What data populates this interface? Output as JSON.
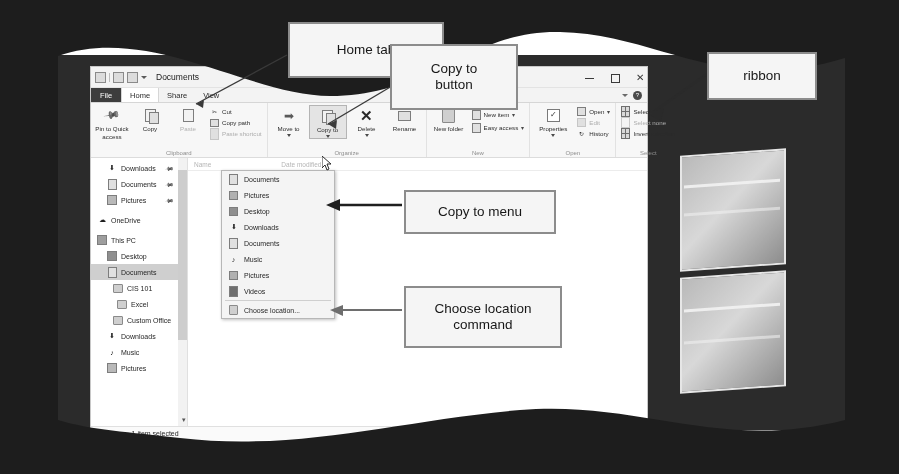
{
  "figure": {
    "kind": "annotated-screenshot"
  },
  "window": {
    "title": "Documents",
    "quick_access_icons": [
      "properties-icon",
      "new-folder-icon",
      "undo-icon",
      "customize-caret-icon"
    ],
    "controls": {
      "minimize": "–",
      "maximize": "□",
      "close": "✕"
    },
    "ribbon_collapse_icon": "chevron-down-icon",
    "help_icon": "?"
  },
  "tabs": [
    {
      "label": "File",
      "state": "file"
    },
    {
      "label": "Home",
      "state": "active"
    },
    {
      "label": "Share",
      "state": "normal"
    },
    {
      "label": "View",
      "state": "normal"
    }
  ],
  "ribbon": {
    "groups": [
      {
        "label": "Clipboard",
        "big_buttons": [
          {
            "label": "Pin to Quick\naccess",
            "icon": "pin-icon"
          },
          {
            "label": "Copy",
            "icon": "copy-icon"
          },
          {
            "label": "Paste",
            "icon": "paste-icon",
            "disabled": true
          }
        ],
        "small_buttons": [
          {
            "label": "Cut",
            "icon": "scissors-icon",
            "disabled": false
          },
          {
            "label": "Copy path",
            "icon": "copy-path-icon",
            "disabled": false
          },
          {
            "label": "Paste shortcut",
            "icon": "paste-shortcut-icon",
            "disabled": true
          }
        ]
      },
      {
        "label": "Organize",
        "big_buttons": [
          {
            "label": "Move\nto",
            "icon": "move-to-icon",
            "has_caret": true
          },
          {
            "label": "Copy\nto",
            "icon": "copy-to-icon",
            "has_caret": true,
            "selected": true
          },
          {
            "label": "Delete",
            "icon": "delete-x-icon",
            "has_caret": true
          },
          {
            "label": "Rename",
            "icon": "rename-icon"
          }
        ],
        "small_buttons": []
      },
      {
        "label": "New",
        "big_buttons": [
          {
            "label": "New\nfolder",
            "icon": "new-folder-icon"
          }
        ],
        "small_buttons": [
          {
            "label": "New item",
            "icon": "new-item-icon",
            "has_caret": true
          },
          {
            "label": "Easy access",
            "icon": "easy-access-icon",
            "has_caret": true
          }
        ]
      },
      {
        "label": "Open",
        "big_buttons": [
          {
            "label": "Properties",
            "icon": "properties-check-icon",
            "has_caret": true
          }
        ],
        "small_buttons": [
          {
            "label": "Open",
            "icon": "open-icon",
            "has_caret": true
          },
          {
            "label": "Edit",
            "icon": "edit-icon",
            "disabled": true
          },
          {
            "label": "History",
            "icon": "history-icon"
          }
        ]
      },
      {
        "label": "Select",
        "big_buttons": [],
        "small_buttons": [
          {
            "label": "Select all",
            "icon": "select-all-icon"
          },
          {
            "label": "Select none",
            "icon": "select-none-icon",
            "disabled": true
          },
          {
            "label": "Invert selection",
            "icon": "invert-selection-icon"
          }
        ]
      }
    ]
  },
  "nav_pane": {
    "items": [
      {
        "label": "Downloads",
        "icon": "download-arrow-icon",
        "indent": 1,
        "pinned": true
      },
      {
        "label": "Documents",
        "icon": "document-icon",
        "indent": 1,
        "pinned": true
      },
      {
        "label": "Pictures",
        "icon": "pictures-icon",
        "indent": 1,
        "pinned": true
      },
      {
        "label": "OneDrive",
        "icon": "cloud-icon",
        "indent": 0
      },
      {
        "label": "This PC",
        "icon": "monitor-icon",
        "indent": 0
      },
      {
        "label": "Desktop",
        "icon": "desktop-icon",
        "indent": 1
      },
      {
        "label": "Documents",
        "icon": "document-icon",
        "indent": 1,
        "selected": true
      },
      {
        "label": "CIS 101",
        "icon": "folder-icon",
        "indent": 2
      },
      {
        "label": "Excel",
        "icon": "folder-icon",
        "indent": 3
      },
      {
        "label": "Custom Office",
        "icon": "folder-icon",
        "indent": 2
      },
      {
        "label": "Downloads",
        "icon": "download-arrow-icon",
        "indent": 1
      },
      {
        "label": "Music",
        "icon": "music-note-icon",
        "indent": 1
      },
      {
        "label": "Pictures",
        "icon": "pictures-icon",
        "indent": 1
      }
    ],
    "scroll_down_icon": "chevron-down-icon"
  },
  "copy_to_menu": {
    "items": [
      {
        "label": "Documents",
        "icon": "document-icon"
      },
      {
        "label": "Pictures",
        "icon": "pictures-icon"
      },
      {
        "label": "Desktop",
        "icon": "desktop-icon"
      },
      {
        "label": "Downloads",
        "icon": "download-arrow-icon"
      },
      {
        "label": "Documents",
        "icon": "document-icon"
      },
      {
        "label": "Music",
        "icon": "music-note-icon"
      },
      {
        "label": "Pictures",
        "icon": "pictures-icon"
      },
      {
        "label": "Videos",
        "icon": "video-icon"
      }
    ],
    "final_command": {
      "label": "Choose location...",
      "icon": "folder-icon"
    }
  },
  "column_headers": [
    "Name",
    "Date modified"
  ],
  "status_bar": {
    "item_count": "2 items",
    "selection": "1 item selected",
    "view_buttons": [
      "details-view-icon",
      "large-icons-view-icon"
    ]
  },
  "callouts": [
    {
      "id": "home-tab",
      "text": "Home tab"
    },
    {
      "id": "copy-to-button",
      "text": "Copy to\nbutton"
    },
    {
      "id": "ribbon",
      "text": "ribbon"
    },
    {
      "id": "copy-to-menu",
      "text": "Copy to menu"
    },
    {
      "id": "choose-location-command",
      "text": "Choose location\ncommand"
    }
  ],
  "colors": {
    "page_background": "#ffffff",
    "frame_dark": "#1d1d1d",
    "desktop": "#2b2b2b",
    "window_chrome": "#f3f3f3",
    "ribbon": "#f7f7f7",
    "file_tab": "#3d3d3d",
    "selection": "#cfcfcf",
    "callout_border": "#8c8c8c",
    "callout_fill": "#f5f5f5"
  }
}
